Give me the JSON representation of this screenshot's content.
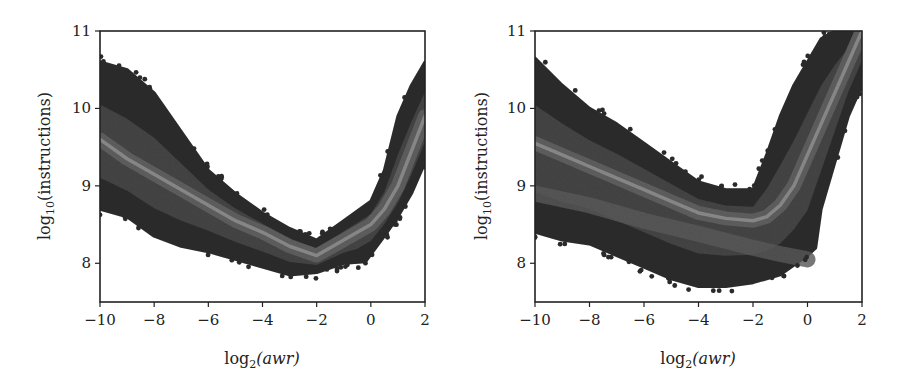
{
  "chart_data": [
    {
      "type": "heatmap",
      "subtype": "hexbin",
      "panel": "left",
      "title": "",
      "xlabel": "log2(awr)",
      "ylabel": "log10(instructions)",
      "xlim": [
        -10,
        2
      ],
      "ylim": [
        7.5,
        11
      ],
      "xticks": [
        -10,
        -8,
        -6,
        -4,
        -2,
        0,
        2
      ],
      "xtick_labels": [
        "−10",
        "−8",
        "−6",
        "−4",
        "−2",
        "0",
        "2"
      ],
      "yticks": [
        8,
        9,
        10,
        11
      ],
      "ytick_labels": [
        "8",
        "9",
        "10",
        "11"
      ],
      "grid": false,
      "legend": null,
      "colormap": "grayscale (dark = sparse, light = dense)",
      "density_ridge": {
        "x": [
          -10,
          -9,
          -8,
          -7,
          -6,
          -5,
          -4,
          -3,
          -2,
          -1.5,
          -1,
          -0.5,
          0,
          0.5,
          1,
          1.5,
          2
        ],
        "y": [
          9.6,
          9.35,
          9.15,
          8.95,
          8.75,
          8.55,
          8.4,
          8.22,
          8.1,
          8.2,
          8.3,
          8.4,
          8.5,
          8.7,
          9.0,
          9.45,
          9.9
        ]
      },
      "envelope_upper": {
        "x": [
          -10,
          -9,
          -8,
          -7,
          -6,
          -5,
          -4,
          -3,
          -2,
          -1,
          0,
          0.5,
          1,
          1.5,
          2
        ],
        "y": [
          10.6,
          10.5,
          10.2,
          9.7,
          9.2,
          8.9,
          8.65,
          8.45,
          8.3,
          8.55,
          8.8,
          9.2,
          9.9,
          10.3,
          10.6
        ]
      },
      "envelope_lower": {
        "x": [
          -10,
          -9,
          -8,
          -7,
          -6,
          -5,
          -4,
          -3,
          -2,
          -1,
          -0.2,
          0.5,
          1,
          1.5,
          2
        ],
        "y": [
          8.7,
          8.6,
          8.35,
          8.22,
          8.15,
          8.05,
          7.95,
          7.85,
          7.88,
          8.0,
          8.02,
          8.35,
          8.6,
          8.9,
          9.3
        ]
      }
    },
    {
      "type": "heatmap",
      "subtype": "hexbin",
      "panel": "right",
      "title": "",
      "xlabel": "log2(awr)",
      "ylabel": "log10(instructions)",
      "xlim": [
        -10,
        2
      ],
      "ylim": [
        7.5,
        11
      ],
      "xticks": [
        -10,
        -8,
        -6,
        -4,
        -2,
        0,
        2
      ],
      "xtick_labels": [
        "−10",
        "−8",
        "−6",
        "−4",
        "−2",
        "0",
        "2"
      ],
      "yticks": [
        8,
        9,
        10,
        11
      ],
      "ytick_labels": [
        "8",
        "9",
        "10",
        "11"
      ],
      "grid": false,
      "legend": null,
      "colormap": "grayscale (dark = sparse, light = dense)",
      "density_ridge": {
        "x": [
          -10,
          -9,
          -8,
          -7,
          -6,
          -5,
          -4,
          -3,
          -2,
          -1.5,
          -1,
          -0.5,
          0,
          0.5,
          1,
          1.5,
          2
        ],
        "y": [
          9.55,
          9.4,
          9.25,
          9.1,
          8.95,
          8.8,
          8.65,
          8.58,
          8.55,
          8.6,
          8.75,
          9.0,
          9.4,
          9.8,
          10.2,
          10.6,
          11.0
        ]
      },
      "secondary_ridge": {
        "x": [
          -10,
          -8,
          -6,
          -4,
          -2,
          -1,
          0
        ],
        "y": [
          8.9,
          8.75,
          8.55,
          8.38,
          8.2,
          8.12,
          8.05
        ]
      },
      "envelope_upper": {
        "x": [
          -10,
          -9,
          -8,
          -7,
          -6,
          -5,
          -4,
          -3,
          -2,
          -1.5,
          -1,
          -0.5,
          0,
          0.5,
          1,
          1.5,
          2
        ],
        "y": [
          10.65,
          10.3,
          10.0,
          9.8,
          9.55,
          9.3,
          9.05,
          8.95,
          8.95,
          9.4,
          9.9,
          10.3,
          10.6,
          10.9,
          11.0,
          11.0,
          11.0
        ]
      },
      "envelope_lower": {
        "x": [
          -10,
          -9,
          -8,
          -7,
          -6,
          -5,
          -4,
          -3,
          -2,
          -1,
          0,
          0.3,
          0.5,
          1,
          1.5,
          2
        ],
        "y": [
          8.4,
          8.3,
          8.25,
          8.1,
          7.95,
          7.8,
          7.7,
          7.7,
          7.75,
          7.85,
          8.1,
          8.2,
          8.7,
          9.3,
          9.9,
          10.3
        ]
      }
    }
  ],
  "panels": {
    "left": {
      "xlabel_main": "log",
      "xlabel_sub": "2",
      "xlabel_arg": "(awr)",
      "ylabel_main": "log",
      "ylabel_sub": "10",
      "ylabel_arg": "(instructions)",
      "xtick_labels": [
        "−10",
        "−8",
        "−6",
        "−4",
        "−2",
        "0",
        "2"
      ],
      "ytick_labels": [
        "8",
        "9",
        "10",
        "11"
      ]
    },
    "right": {
      "xlabel_main": "log",
      "xlabel_sub": "2",
      "xlabel_arg": "(awr)",
      "ylabel_main": "log",
      "ylabel_sub": "10",
      "ylabel_arg": "(instructions)",
      "xtick_labels": [
        "−10",
        "−8",
        "−6",
        "−4",
        "−2",
        "0",
        "2"
      ],
      "ytick_labels": [
        "8",
        "9",
        "10",
        "11"
      ]
    }
  },
  "colors": {
    "sparse": "#2e2e2e",
    "mid": "#4a4a4a",
    "dense": "#7a7a7a",
    "ridge": "#8c8c8c",
    "axis": "#222222"
  }
}
